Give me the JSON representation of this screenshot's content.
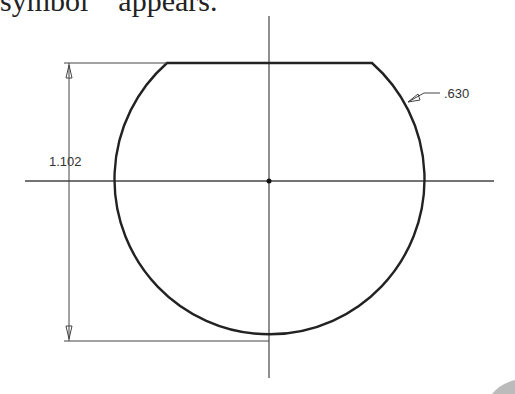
{
  "caption": "symbol    appears.",
  "drawing": {
    "dimension_vertical": "1.102",
    "dimension_radius": ".630"
  }
}
